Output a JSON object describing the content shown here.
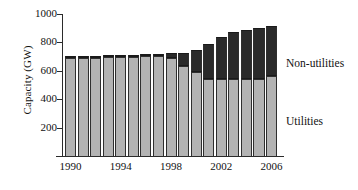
{
  "chart_data": {
    "type": "bar",
    "stacked": true,
    "title": "",
    "xlabel": "",
    "ylabel": "Capacity (GW)",
    "ylim": [
      0,
      1000
    ],
    "yticks": [
      200,
      400,
      600,
      800,
      1000
    ],
    "ytick_labels": [
      "200",
      "400",
      "600",
      "800",
      "1000"
    ],
    "grid": false,
    "legend_position": "right-inline",
    "x": [
      1990,
      1991,
      1992,
      1993,
      1994,
      1995,
      1996,
      1997,
      1998,
      1999,
      2000,
      2001,
      2002,
      2003,
      2004,
      2005,
      2006
    ],
    "categories": [
      "1990",
      "1991",
      "1992",
      "1993",
      "1994",
      "1995",
      "1996",
      "1997",
      "1998",
      "1999",
      "2000",
      "2001",
      "2002",
      "2003",
      "2004",
      "2005",
      "2006"
    ],
    "xtick_labels": [
      "1990",
      "1994",
      "1998",
      "2002",
      "2006"
    ],
    "xtick_values": [
      1990,
      1994,
      1998,
      2002,
      2006
    ],
    "series": [
      {
        "name": "Utilities",
        "color": "#b3b3b3",
        "values": [
          690,
          690,
          692,
          694,
          698,
          700,
          702,
          704,
          690,
          635,
          595,
          540,
          545,
          540,
          540,
          545,
          560
        ]
      },
      {
        "name": "Non-utilities",
        "color": "#2a2a2a",
        "values": [
          8,
          10,
          10,
          12,
          12,
          12,
          14,
          14,
          35,
          90,
          155,
          250,
          290,
          330,
          345,
          360,
          355
        ]
      }
    ],
    "totals": [
      698,
      700,
      702,
      706,
      710,
      712,
      716,
      718,
      725,
      725,
      750,
      790,
      835,
      870,
      885,
      905,
      915
    ],
    "annotations": [
      {
        "text": "Non-utilities",
        "target_series": "Non-utilities"
      },
      {
        "text": "Utilities",
        "target_series": "Utilities"
      }
    ]
  }
}
